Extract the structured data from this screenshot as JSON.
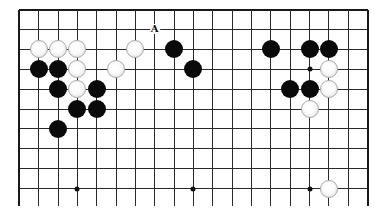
{
  "diagram": {
    "type": "go-board-fragment",
    "columns": 19,
    "visible_rows": 10,
    "open_edge": "bottom",
    "colors": {
      "line": "#2a2a2a",
      "black_stone": "#0a0a0a",
      "white_stone": "#f5f5f5",
      "background": "#ffffff"
    },
    "star_points": [
      [
        3,
        3
      ],
      [
        9,
        3
      ],
      [
        15,
        3
      ],
      [
        3,
        9
      ],
      [
        9,
        9
      ],
      [
        15,
        9
      ]
    ],
    "black_stones": [
      [
        8,
        2
      ],
      [
        13,
        2
      ],
      [
        15,
        2
      ],
      [
        16,
        2
      ],
      [
        1,
        3
      ],
      [
        2,
        3
      ],
      [
        9,
        3
      ],
      [
        2,
        4
      ],
      [
        4,
        4
      ],
      [
        14,
        4
      ],
      [
        15,
        4
      ],
      [
        3,
        5
      ],
      [
        4,
        5
      ],
      [
        2,
        6
      ]
    ],
    "white_stones": [
      [
        1,
        2
      ],
      [
        2,
        2
      ],
      [
        3,
        2
      ],
      [
        6,
        2
      ],
      [
        3,
        3
      ],
      [
        5,
        3
      ],
      [
        16,
        3
      ],
      [
        3,
        4
      ],
      [
        16,
        4
      ],
      [
        15,
        5
      ],
      [
        16,
        9
      ]
    ],
    "labels": [
      {
        "text": "A",
        "col": 7,
        "row": 1
      }
    ]
  }
}
